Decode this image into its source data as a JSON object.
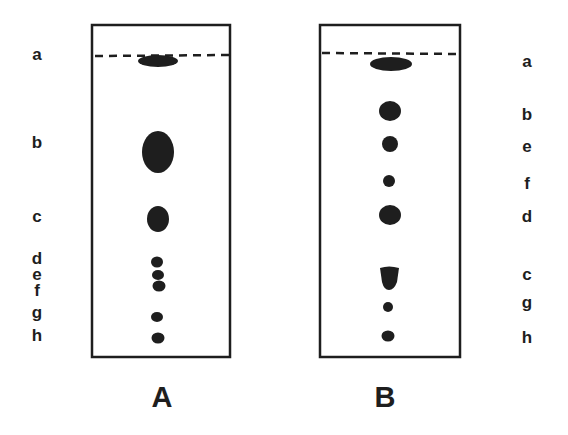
{
  "figure": {
    "type": "thin-layer chromatography plates",
    "ink_color": "#1e1e1e",
    "background": "#ffffff"
  },
  "plates": [
    {
      "id": "A",
      "label": "A",
      "label_side": "left",
      "spot_order_top_to_bottom": [
        "a",
        "b",
        "c",
        "d",
        "e",
        "f",
        "g",
        "h"
      ],
      "side_labels": [
        {
          "text": "a",
          "y": 60
        },
        {
          "text": "b",
          "y": 148
        },
        {
          "text": "c",
          "y": 222
        },
        {
          "text": "d",
          "y": 264
        },
        {
          "text": "e",
          "y": 280
        },
        {
          "text": "f",
          "y": 296
        },
        {
          "text": "g",
          "y": 321
        },
        {
          "text": "h",
          "y": 341
        }
      ]
    },
    {
      "id": "B",
      "label": "B",
      "label_side": "right",
      "spot_order_top_to_bottom": [
        "a",
        "b",
        "e",
        "f",
        "d",
        "c",
        "g",
        "h"
      ],
      "side_labels": [
        {
          "text": "a",
          "y": 67
        },
        {
          "text": "b",
          "y": 120
        },
        {
          "text": "e",
          "y": 152
        },
        {
          "text": "f",
          "y": 189
        },
        {
          "text": "d",
          "y": 222
        },
        {
          "text": "c",
          "y": 280
        },
        {
          "text": "g",
          "y": 310
        },
        {
          "text": "h",
          "y": 343
        }
      ]
    }
  ]
}
